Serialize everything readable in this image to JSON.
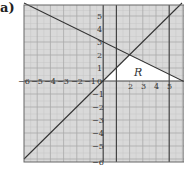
{
  "part_label": "a)",
  "region_label": "R",
  "axes": {
    "x_ticks": [
      "−6",
      "−5",
      "−4",
      "−3",
      "−2",
      "−1",
      "0",
      "2",
      "3",
      "4",
      "5"
    ],
    "y_ticks_pos": [
      "5",
      "4",
      "3",
      "2",
      "1"
    ],
    "y_ticks_neg": [
      "−1",
      "−2",
      "−3",
      "−4",
      "−5",
      "−6"
    ],
    "x_range": [
      -6,
      6
    ],
    "y_range": [
      -6,
      6
    ]
  },
  "lines": [
    {
      "name": "y = 3 - x/2",
      "from": [
        -6,
        6
      ],
      "to": [
        6,
        0
      ]
    },
    {
      "name": "y = x",
      "from": [
        -6,
        -6
      ],
      "to": [
        6,
        6
      ]
    },
    {
      "name": "x = 1",
      "vertical": 1
    },
    {
      "name": "x = 5",
      "vertical": 5
    }
  ],
  "region": {
    "label": "R",
    "vertices": [
      [
        0,
        0
      ],
      [
        2,
        2
      ],
      [
        6,
        0
      ]
    ]
  },
  "colors": {
    "grid_bg": "#d9d9d9",
    "grid_line": "#bdbdbd",
    "axis": "#444444",
    "curve": "#333333",
    "region": "#ffffff"
  }
}
